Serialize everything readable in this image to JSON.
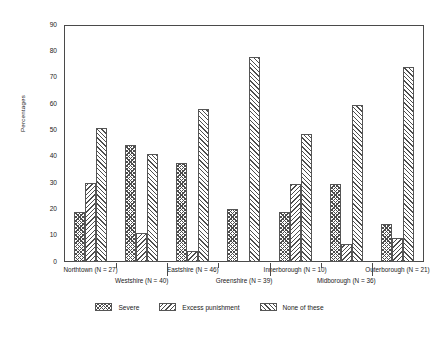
{
  "chart_data": {
    "type": "bar",
    "title": "",
    "xlabel": "",
    "ylabel": "Percentages",
    "ylim": [
      0,
      90
    ],
    "ytick_step": 10,
    "yticks": [
      0,
      10,
      20,
      30,
      40,
      50,
      60,
      70,
      80,
      90
    ],
    "grid": false,
    "legend_position": "bottom",
    "categories": [
      "Northtown (N = 27)",
      "Westshire (N = 40)",
      "Eastshire (N = 46)",
      "Greenshire (N = 39)",
      "Innerborough (N = 10)",
      "Midborough (N = 36)",
      "Outerborough (N = 21)"
    ],
    "series": [
      {
        "name": "Severe",
        "values": [
          19,
          44.5,
          37.5,
          20,
          19,
          29.5,
          14.5
        ]
      },
      {
        "name": "Excess punishment",
        "values": [
          30,
          11,
          4,
          0,
          29.5,
          7,
          9
        ]
      },
      {
        "name": "None of these",
        "values": [
          51,
          41,
          58,
          78,
          48.5,
          59.5,
          74
        ]
      }
    ]
  },
  "legend": {
    "items": [
      {
        "label": "Severe",
        "pattern": "crosshatch-icon"
      },
      {
        "label": "Excess punishment",
        "pattern": "backslash-hatch-icon"
      },
      {
        "label": "None of these",
        "pattern": "forwardslash-hatch-icon"
      }
    ]
  },
  "axis": {
    "y_label": "Percentages",
    "y_tick_labels": [
      "0",
      "10",
      "20",
      "30",
      "40",
      "50",
      "60",
      "70",
      "80",
      "90"
    ]
  }
}
